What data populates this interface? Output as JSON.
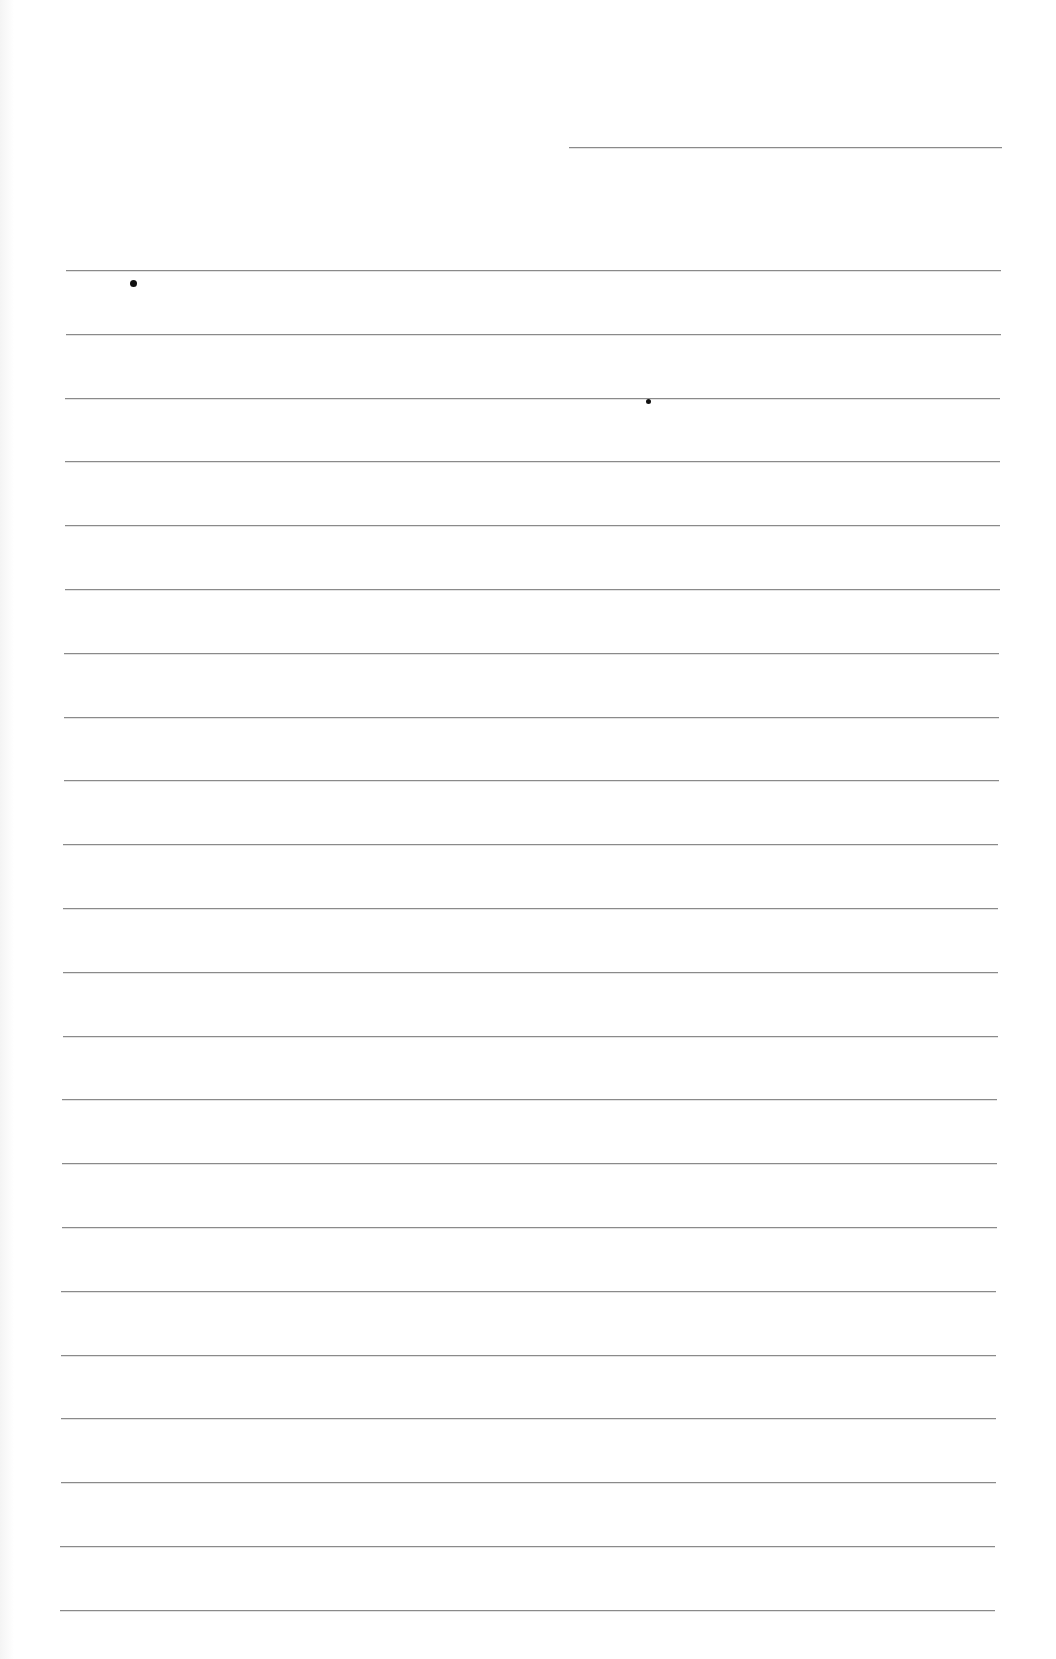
{
  "page": {
    "type": "blank lined paper",
    "background": "#ffffff",
    "line_color": "#8a8a8a",
    "header_line": {
      "x1": 569,
      "x2": 1002,
      "y": 147
    },
    "ruled_lines": {
      "count": 22,
      "first_y": 270,
      "spacing": 63.8,
      "x_start_first": 66,
      "x_end_first": 1001,
      "x_start_last": 60,
      "x_end_last": 995
    },
    "marks": [
      {
        "name": "dot",
        "x": 133,
        "y": 283,
        "size": 7
      },
      {
        "name": "dot",
        "x": 648,
        "y": 401,
        "size": 5
      }
    ]
  }
}
